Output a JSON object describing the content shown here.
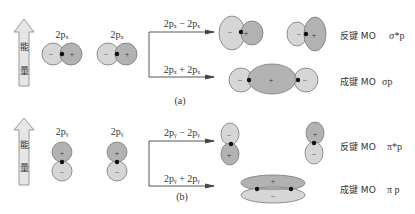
{
  "panel_a": {
    "arrow_label_1": "能",
    "arrow_label_2": "量",
    "ao_left_label": "2pₓ",
    "ao_right_label": "2pₓ",
    "upper_combo": "2pₓ − 2pₓ",
    "lower_combo": "2pₓ + 2pₓ",
    "antibonding_label": "反键 MO",
    "antibonding_symbol": "σ*p",
    "bonding_label": "成键 MO",
    "bonding_symbol": "σp",
    "caption": "(a)",
    "signs": {
      "minus": "−",
      "plus": "+"
    }
  },
  "panel_b": {
    "arrow_label_1": "能",
    "arrow_label_2": "量",
    "ao_left_label": "2pᵧ",
    "ao_right_label": "2pᵧ",
    "upper_combo": "2pᵧ − 2pᵧ",
    "lower_combo": "2pᵧ + 2pᵧ",
    "antibonding_label": "反键 MO",
    "antibonding_symbol": "π*p",
    "bonding_label": "成键 MO",
    "bonding_symbol": "π p",
    "caption": "(b)",
    "signs": {
      "minus": "−",
      "plus": "+"
    }
  },
  "colors": {
    "light_lobe": "#d6d6d6",
    "dark_lobe": "#b2b2b2",
    "stroke": "#555555",
    "arrow_fill": "#e6e6e6"
  }
}
